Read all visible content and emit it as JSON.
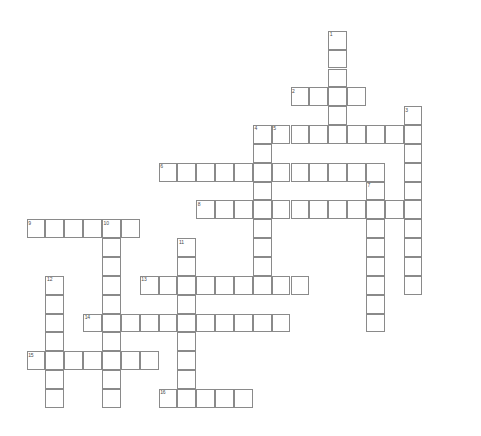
{
  "puzzle": {
    "kind": "crossword-grid",
    "title": "Crossword Puzzle Grid",
    "canvas": {
      "width": 481,
      "height": 436
    },
    "geometry": {
      "cell_size": 18.85,
      "origin_x": 26.6,
      "origin_y": 30.8,
      "line_color": "#8a8a8a",
      "number_color": "#4a4a4a",
      "background": "#ffffff"
    },
    "entries": [
      {
        "number": "1",
        "direction": "down",
        "col": 16,
        "row": 0,
        "length": 6,
        "label": "1"
      },
      {
        "number": "2",
        "direction": "across",
        "col": 14,
        "row": 3,
        "length": 4,
        "label": "2"
      },
      {
        "number": "3",
        "direction": "down",
        "col": 20,
        "row": 4,
        "length": 10,
        "label": "3"
      },
      {
        "number": "4",
        "direction": "down",
        "col": 12,
        "row": 5,
        "length": 8,
        "label": "4"
      },
      {
        "number": "5",
        "direction": "across",
        "col": 13,
        "row": 5,
        "length": 8,
        "label": "5"
      },
      {
        "number": "6",
        "direction": "across",
        "col": 7,
        "row": 7,
        "length": 12,
        "label": "6"
      },
      {
        "number": "7",
        "direction": "down",
        "col": 18,
        "row": 8,
        "length": 8,
        "label": "7"
      },
      {
        "number": "8",
        "direction": "across",
        "col": 9,
        "row": 9,
        "length": 12,
        "label": "8"
      },
      {
        "number": "9",
        "direction": "across",
        "col": 0,
        "row": 10,
        "length": 6,
        "label": "9"
      },
      {
        "number": "10",
        "direction": "down",
        "col": 4,
        "row": 10,
        "length": 10,
        "label": "10"
      },
      {
        "number": "11",
        "direction": "down",
        "col": 8,
        "row": 11,
        "length": 9,
        "label": "11"
      },
      {
        "number": "12",
        "direction": "down",
        "col": 1,
        "row": 13,
        "length": 7,
        "label": "12"
      },
      {
        "number": "13",
        "direction": "across",
        "col": 6,
        "row": 13,
        "length": 9,
        "label": "13"
      },
      {
        "number": "14",
        "direction": "across",
        "col": 3,
        "row": 15,
        "length": 11,
        "label": "14"
      },
      {
        "number": "15",
        "direction": "across",
        "col": 0,
        "row": 17,
        "length": 7,
        "label": "15"
      },
      {
        "number": "16",
        "direction": "across",
        "col": 7,
        "row": 19,
        "length": 5,
        "label": "16"
      }
    ]
  }
}
